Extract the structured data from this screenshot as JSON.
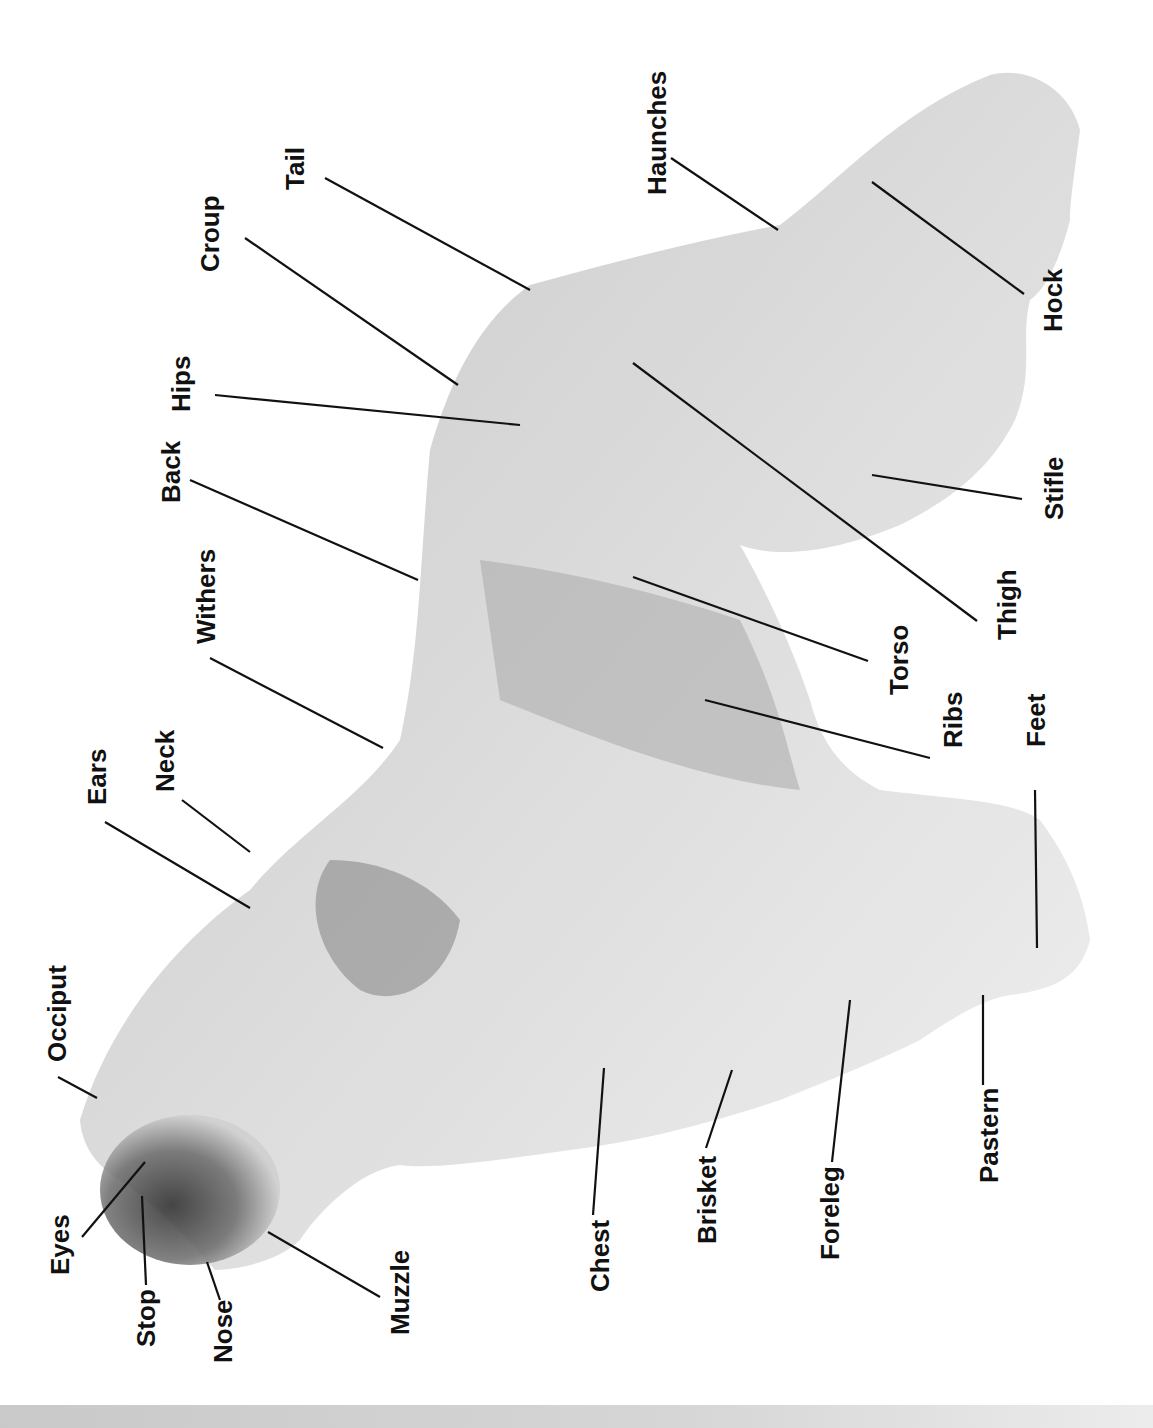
{
  "diagram": {
    "orientation": "rotated -90 degrees",
    "colors": {
      "background": "#ffffff",
      "text": "#111111",
      "leader_line": "#111111",
      "coat_light": "#e8e8e8",
      "coat_mid": "#bdbdbd",
      "coat_dark": "#6e6e6e",
      "bottom_bar": "#cfcfcf"
    },
    "labels": [
      {
        "id": "tail",
        "text": "Tail"
      },
      {
        "id": "croup",
        "text": "Croup"
      },
      {
        "id": "hips",
        "text": "Hips"
      },
      {
        "id": "back",
        "text": "Back"
      },
      {
        "id": "withers",
        "text": "Withers"
      },
      {
        "id": "neck",
        "text": "Neck"
      },
      {
        "id": "ears",
        "text": "Ears"
      },
      {
        "id": "occiput",
        "text": "Occiput"
      },
      {
        "id": "eyes",
        "text": "Eyes"
      },
      {
        "id": "stop",
        "text": "Stop"
      },
      {
        "id": "nose",
        "text": "Nose"
      },
      {
        "id": "muzzle",
        "text": "Muzzle"
      },
      {
        "id": "chest",
        "text": "Chest"
      },
      {
        "id": "brisket",
        "text": "Brisket"
      },
      {
        "id": "foreleg",
        "text": "Foreleg"
      },
      {
        "id": "pastern",
        "text": "Pastern"
      },
      {
        "id": "feet",
        "text": "Feet"
      },
      {
        "id": "ribs",
        "text": "Ribs"
      },
      {
        "id": "torso",
        "text": "Torso"
      },
      {
        "id": "thigh",
        "text": "Thigh"
      },
      {
        "id": "stifle",
        "text": "Stifle"
      },
      {
        "id": "hock",
        "text": "Hock"
      },
      {
        "id": "haunches",
        "text": "Haunches"
      }
    ]
  }
}
